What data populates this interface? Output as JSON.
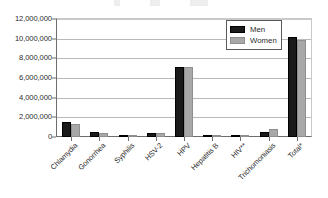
{
  "chart_data": {
    "type": "bar",
    "title": "",
    "xlabel": "",
    "ylabel": "",
    "ylim": [
      0,
      12000000
    ],
    "grid": true,
    "legend_position": "upper-right-inside",
    "categories": [
      "Chlamydia",
      "Gonorrhea",
      "Syphilis",
      "HSV-2",
      "HPV",
      "Hepatitis B",
      "HIV**",
      "Trichomoniasis",
      "Total*"
    ],
    "y_ticks": [
      0,
      2000000,
      4000000,
      6000000,
      8000000,
      10000000,
      12000000
    ],
    "y_tick_labels": [
      "0",
      "2,000,000",
      "4,000,000",
      "6,000,000",
      "8,000,000",
      "10,000,000",
      "12,000,000"
    ],
    "series": [
      {
        "name": "Men",
        "color": "#1a1a1a",
        "values": [
          1550000,
          500000,
          90000,
          440000,
          7100000,
          90000,
          100000,
          530000,
          10200000
        ]
      },
      {
        "name": "Women",
        "color": "#a8a8a8",
        "values": [
          1340000,
          420000,
          60000,
          420000,
          7150000,
          60000,
          40000,
          800000,
          9900000
        ]
      }
    ]
  },
  "legend": {
    "entries": [
      {
        "label": "Men",
        "swatch": "black-square-swatch"
      },
      {
        "label": "Women",
        "swatch": "gray-square-swatch"
      }
    ]
  },
  "title_artifact": ""
}
